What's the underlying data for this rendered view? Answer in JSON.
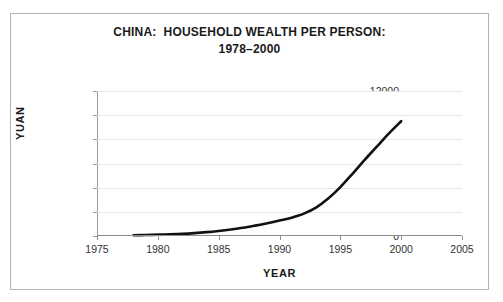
{
  "figure": {
    "background_color": "#ffffff",
    "border_color": "#b3b3b3"
  },
  "title": {
    "line1": "CHINA:  HOUSEHOLD WEALTH PER PERSON:",
    "line2": "1978–2000"
  },
  "axes": {
    "ylabel": "YUAN",
    "xlabel": "YEAR",
    "ytick_labels": [
      "0",
      "2000",
      "4000",
      "6000",
      "8000",
      "10000",
      "12000"
    ],
    "xtick_labels": [
      "1975",
      "1980",
      "1985",
      "1990",
      "1995",
      "2000",
      "2005"
    ]
  },
  "chart_data": {
    "type": "line",
    "title": "CHINA:  HOUSEHOLD WEALTH PER PERSON: 1978–2000",
    "xlabel": "YEAR",
    "ylabel": "YUAN",
    "xlim": [
      1975,
      2005
    ],
    "ylim": [
      0,
      12000
    ],
    "xticks": [
      1975,
      1980,
      1985,
      1990,
      1995,
      2000,
      2005
    ],
    "yticks": [
      0,
      2000,
      4000,
      6000,
      8000,
      10000,
      12000
    ],
    "grid": "horizontal",
    "legend": "none",
    "line_color": "#111111",
    "line_width": 2.6,
    "series": [
      {
        "name": "Household wealth per person",
        "units": "yuan",
        "x": [
          1978,
          1979,
          1980,
          1981,
          1982,
          1983,
          1984,
          1985,
          1986,
          1987,
          1988,
          1989,
          1990,
          1991,
          1992,
          1993,
          1994,
          1995,
          1996,
          1997,
          1998,
          1999,
          2000
        ],
        "values": [
          60,
          80,
          110,
          140,
          180,
          240,
          320,
          420,
          540,
          680,
          860,
          1060,
          1280,
          1520,
          1850,
          2350,
          3100,
          4050,
          5150,
          6300,
          7400,
          8500,
          9500
        ]
      }
    ]
  }
}
